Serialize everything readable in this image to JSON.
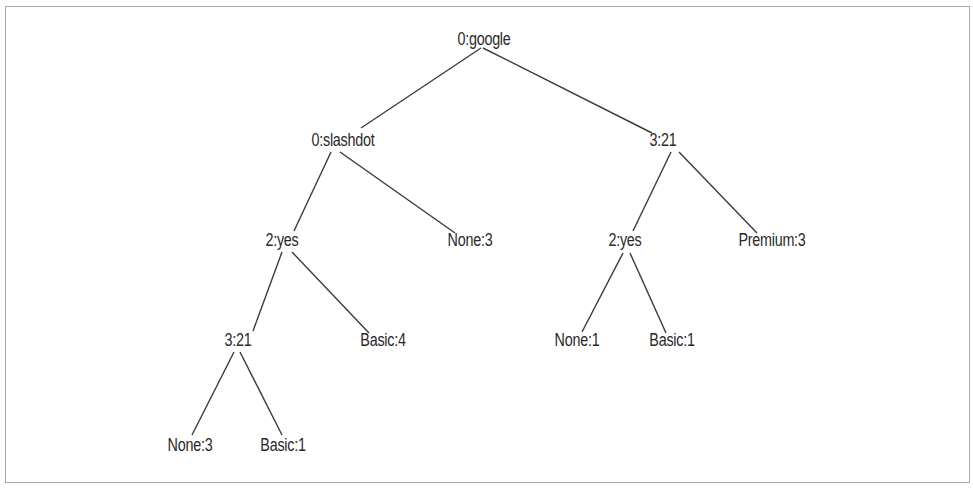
{
  "diagram": {
    "type": "decision-tree",
    "nodes": [
      {
        "id": "n0",
        "label": "0:google",
        "x": 484,
        "y": 39,
        "kind": "decision"
      },
      {
        "id": "n1",
        "label": "0:slashdot",
        "x": 343,
        "y": 140,
        "kind": "decision"
      },
      {
        "id": "n2",
        "label": "3:21",
        "x": 663,
        "y": 140,
        "kind": "decision"
      },
      {
        "id": "n3",
        "label": "2:yes",
        "x": 282,
        "y": 240,
        "kind": "decision"
      },
      {
        "id": "n4",
        "label": "None:3",
        "x": 470,
        "y": 240,
        "kind": "leaf"
      },
      {
        "id": "n5",
        "label": "2:yes",
        "x": 625,
        "y": 240,
        "kind": "decision"
      },
      {
        "id": "n6",
        "label": "Premium:3",
        "x": 772,
        "y": 240,
        "kind": "leaf"
      },
      {
        "id": "n7",
        "label": "3:21",
        "x": 238,
        "y": 340,
        "kind": "decision"
      },
      {
        "id": "n8",
        "label": "Basic:4",
        "x": 383,
        "y": 340,
        "kind": "leaf"
      },
      {
        "id": "n9",
        "label": "None:1",
        "x": 577,
        "y": 340,
        "kind": "leaf"
      },
      {
        "id": "n10",
        "label": "Basic:1",
        "x": 672,
        "y": 340,
        "kind": "leaf"
      },
      {
        "id": "n11",
        "label": "None:3",
        "x": 190,
        "y": 445,
        "kind": "leaf"
      },
      {
        "id": "n12",
        "label": "Basic:1",
        "x": 283,
        "y": 445,
        "kind": "leaf"
      }
    ],
    "edges": [
      {
        "from": "n0",
        "to": "n1",
        "x1": 481,
        "y1": 48,
        "x2": 361,
        "y2": 128
      },
      {
        "from": "n0",
        "to": "n2",
        "x1": 483,
        "y1": 48,
        "x2": 652,
        "y2": 133
      },
      {
        "from": "n1",
        "to": "n3",
        "x1": 331,
        "y1": 152,
        "x2": 294,
        "y2": 231
      },
      {
        "from": "n1",
        "to": "n4",
        "x1": 340,
        "y1": 152,
        "x2": 455,
        "y2": 233
      },
      {
        "from": "n2",
        "to": "n5",
        "x1": 671,
        "y1": 152,
        "x2": 633,
        "y2": 231
      },
      {
        "from": "n2",
        "to": "n6",
        "x1": 679,
        "y1": 152,
        "x2": 757,
        "y2": 233
      },
      {
        "from": "n3",
        "to": "n7",
        "x1": 282,
        "y1": 252,
        "x2": 253,
        "y2": 331
      },
      {
        "from": "n3",
        "to": "n8",
        "x1": 292,
        "y1": 252,
        "x2": 369,
        "y2": 333
      },
      {
        "from": "n5",
        "to": "n9",
        "x1": 623,
        "y1": 253,
        "x2": 582,
        "y2": 332
      },
      {
        "from": "n5",
        "to": "n10",
        "x1": 630,
        "y1": 253,
        "x2": 666,
        "y2": 333
      },
      {
        "from": "n7",
        "to": "n11",
        "x1": 234,
        "y1": 352,
        "x2": 192,
        "y2": 435
      },
      {
        "from": "n7",
        "to": "n12",
        "x1": 240,
        "y1": 352,
        "x2": 282,
        "y2": 435
      }
    ]
  },
  "colors": {
    "line": "#3a3a3a",
    "text": "#2a2a2a",
    "border": "#a8a8a8",
    "background": "#ffffff"
  }
}
